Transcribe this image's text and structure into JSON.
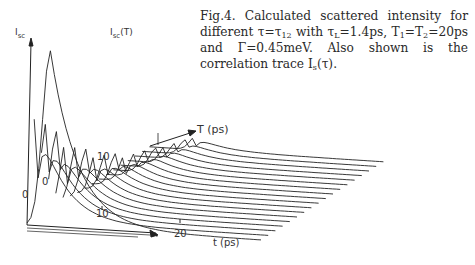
{
  "caption": {
    "fig_label": "Fig.4.",
    "part1": "Calculated scattered intensity for different ",
    "tau": "τ=τ",
    "tau_sub": "12",
    "part2": " with τ",
    "tauL_sub": "L",
    "part3": "=1.4ps, T",
    "T1_sub": "1",
    "part4": "=T",
    "T2_sub": "2",
    "part5": "=20ps and Γ=0.45meV. Also shown is the correlation trace I",
    "Is_sub": "s",
    "part6": "(τ)."
  },
  "chart_data": {
    "type": "line",
    "xlabel": "t (ps)",
    "ylabel": "I_sc",
    "zlabel": "T (ps)",
    "trace_label": "I_sc(T)",
    "x_ticks": [
      "0",
      "10",
      "20"
    ],
    "z_ticks": [
      "0",
      "10"
    ],
    "parameters": {
      "tau_L_ps": 1.4,
      "T1_ps": 20,
      "T2_ps": 20,
      "Gamma_meV": 0.45
    },
    "series_count": 18
  },
  "axes": {
    "y_label": "I",
    "y_label_sub": "sc",
    "trace_label": "I",
    "trace_label_sub": "sc",
    "trace_label_arg": "(T)",
    "z_label": "T (ps)",
    "x_label": "t (ps)",
    "origin": "0",
    "z_tick_0": "0",
    "z_tick_10": "10",
    "x_tick_10": "10",
    "x_tick_20": "20"
  }
}
